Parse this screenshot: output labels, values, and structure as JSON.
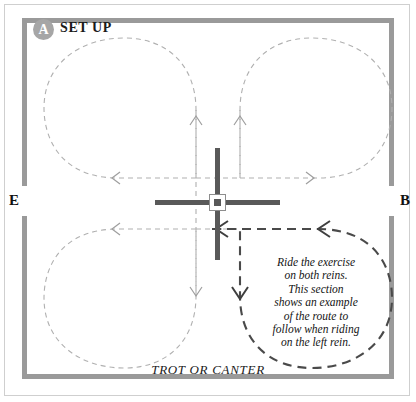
{
  "diagram": {
    "title": "SET UP",
    "badge_letter": "A",
    "gait_caption": "TROT OR CANTER",
    "note_lines": [
      "Ride the exercise",
      "on both reins.",
      "This section",
      "shows an example",
      "of the route to",
      "follow when riding",
      "on the left rein."
    ],
    "markers": {
      "left": "E",
      "right": "B"
    },
    "colors": {
      "arena_border": "#9a9a9a",
      "outer_frame": "#cfcfcf",
      "light_path": "#b0b0b0",
      "example_path": "#4a4a4a",
      "pole": "#595959",
      "badge_fill": "#a6a6a6",
      "text": "#141414"
    },
    "elements": {
      "centre_marker": "centre-square-marker",
      "poles": [
        "vertical-pole",
        "horizontal-pole"
      ],
      "loops": [
        "top-left-loop",
        "top-right-loop",
        "bottom-left-loop",
        "bottom-right-loop-example"
      ]
    }
  }
}
